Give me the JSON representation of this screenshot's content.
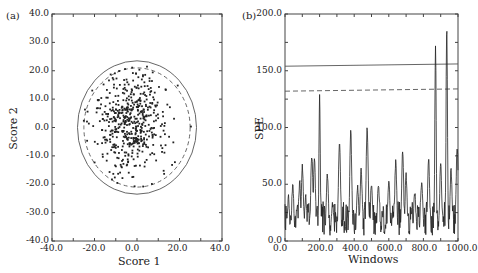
{
  "chart_data": [
    {
      "panel": "(a)",
      "type": "scatter",
      "title": "",
      "xlabel": "Score 1",
      "ylabel": "Score 2",
      "xlim": [
        -40,
        40
      ],
      "ylim": [
        -40,
        40
      ],
      "xticks": [
        "-40.0",
        "-20.0",
        "0.0",
        "20.0",
        "40.0"
      ],
      "yticks": [
        "40.0",
        "30.0",
        "20.0",
        "10.0",
        "0.0",
        "-10.0",
        "-20.0",
        "-30.0",
        "-40.0"
      ],
      "grid": false,
      "legend": null,
      "annotations": [
        {
          "type": "ellipse",
          "style": "solid",
          "center": [
            0,
            0
          ],
          "rx": 28,
          "ry": 23.5,
          "meaning": "outer confidence limit"
        },
        {
          "type": "ellipse",
          "style": "dashed",
          "center": [
            0,
            0
          ],
          "rx": 25,
          "ry": 21,
          "meaning": "inner confidence limit"
        }
      ],
      "points_description": "approx. 500 points clustered around (-3, 2), spread within the ellipses, a few outside the dashed limit",
      "point_cluster": {
        "n": 520,
        "center": [
          -3,
          2
        ],
        "sx": 9,
        "sy": 9.5
      }
    },
    {
      "panel": "(b)",
      "type": "line",
      "title": "",
      "xlabel": "Windows",
      "ylabel": "SPE",
      "xlim": [
        0,
        1000
      ],
      "ylim": [
        0,
        200
      ],
      "xticks": [
        "0.0",
        "200.0",
        "400.0",
        "600.0",
        "800.0",
        "1000.0"
      ],
      "yticks": [
        "200.0",
        "150.0",
        "100.0",
        "50.0",
        "0.0"
      ],
      "grid": false,
      "legend": null,
      "thresholds": [
        {
          "style": "solid",
          "y_start": 154,
          "y_end": 156,
          "meaning": "99% limit"
        },
        {
          "style": "dashed",
          "y_start": 132,
          "y_end": 134,
          "meaning": "95% limit"
        }
      ],
      "peaks": [
        {
          "x": 20,
          "y": 35
        },
        {
          "x": 45,
          "y": 47
        },
        {
          "x": 70,
          "y": 28
        },
        {
          "x": 85,
          "y": 48
        },
        {
          "x": 100,
          "y": 63
        },
        {
          "x": 120,
          "y": 35
        },
        {
          "x": 155,
          "y": 73
        },
        {
          "x": 170,
          "y": 70
        },
        {
          "x": 200,
          "y": 125
        },
        {
          "x": 245,
          "y": 56
        },
        {
          "x": 275,
          "y": 30
        },
        {
          "x": 315,
          "y": 84
        },
        {
          "x": 380,
          "y": 93
        },
        {
          "x": 420,
          "y": 45
        },
        {
          "x": 440,
          "y": 60
        },
        {
          "x": 475,
          "y": 98
        },
        {
          "x": 500,
          "y": 48
        },
        {
          "x": 540,
          "y": 45
        },
        {
          "x": 600,
          "y": 52
        },
        {
          "x": 640,
          "y": 66
        },
        {
          "x": 680,
          "y": 74
        },
        {
          "x": 700,
          "y": 56
        },
        {
          "x": 750,
          "y": 40
        },
        {
          "x": 790,
          "y": 50
        },
        {
          "x": 830,
          "y": 70
        },
        {
          "x": 870,
          "y": 168
        },
        {
          "x": 900,
          "y": 65
        },
        {
          "x": 935,
          "y": 186
        },
        {
          "x": 960,
          "y": 60
        },
        {
          "x": 995,
          "y": 80
        }
      ],
      "baseline_range": [
        5,
        35
      ]
    }
  ]
}
